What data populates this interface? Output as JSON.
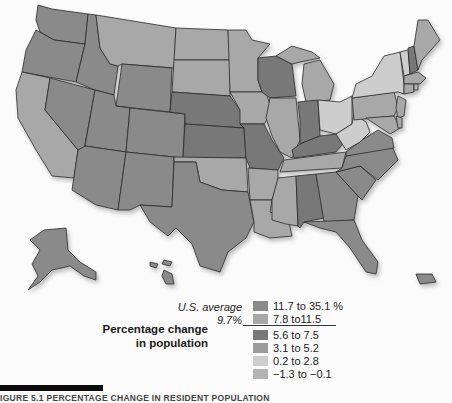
{
  "legend": {
    "title_line1": "Percentage change",
    "title_line2": "in population",
    "average_label": "U.S. average",
    "average_value": "9.7%",
    "classes": [
      {
        "label": "11.7 to 35.1 %",
        "color": "#8a8a8a"
      },
      {
        "label": "7.8 to11.5",
        "color": "#a8a8a8"
      },
      {
        "label": "5.6 to 7.5",
        "color": "#787878"
      },
      {
        "label": "3.1 to 5.2",
        "color": "#9c9c9c"
      },
      {
        "label": "0.2 to 2.8",
        "color": "#cdcdcd"
      },
      {
        "label": "−1.3 to −0.1",
        "color": "#b4b4b4"
      }
    ]
  },
  "caption": "IGURE 5.1  PERCENTAGE CHANGE IN RESIDENT POPULATION",
  "map": {
    "subject": "United States by state",
    "extras": [
      "Alaska",
      "Hawaii",
      "Puerto Rico"
    ]
  }
}
